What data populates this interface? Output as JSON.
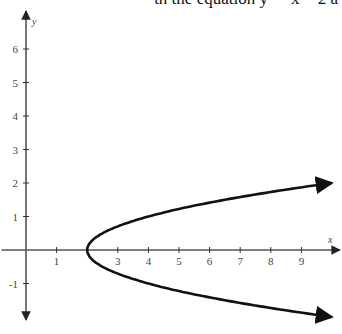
{
  "caption": "th the equation y² = x − 2 a",
  "chart_data": {
    "type": "line",
    "title": "",
    "xlabel": "x",
    "ylabel": "y",
    "xlim": [
      -0.8,
      10.3
    ],
    "ylim": [
      -2.1,
      7.1
    ],
    "x_ticks": [
      1,
      2,
      3,
      4,
      5,
      6,
      7,
      8,
      9
    ],
    "x_tick_labels": [
      "1",
      "",
      "3",
      "4",
      "5",
      "6",
      "7",
      "8",
      "9"
    ],
    "y_ticks": [
      -1,
      1,
      2,
      3,
      4,
      5,
      6
    ],
    "y_tick_labels": [
      "-1",
      "1",
      "2",
      "3",
      "4",
      "5",
      "6"
    ],
    "grid": false,
    "legend": null,
    "series": [
      {
        "name": "sideways parabola (upper branch)",
        "equation": "y = +sqrt((x-2)/2)",
        "x": [
          2,
          2.5,
          3,
          4,
          5,
          6,
          7,
          8,
          9,
          10
        ],
        "y": [
          0,
          0.5,
          0.71,
          1.0,
          1.22,
          1.41,
          1.58,
          1.73,
          1.87,
          2.0
        ]
      },
      {
        "name": "sideways parabola (lower branch)",
        "equation": "y = -sqrt((x-2)/2)",
        "x": [
          2,
          2.5,
          3,
          4,
          5,
          6,
          7,
          8,
          9,
          10
        ],
        "y": [
          0,
          -0.5,
          -0.71,
          -1.0,
          -1.22,
          -1.41,
          -1.58,
          -1.73,
          -1.87,
          -2.0
        ]
      }
    ],
    "annotations": [
      "vertex at (2, 0)",
      "arrowheads at branch ends",
      "arrowheads on positive/negative axes"
    ]
  },
  "colors": {
    "axis": "#555555",
    "curve": "#111111",
    "background": "#ffffff"
  }
}
